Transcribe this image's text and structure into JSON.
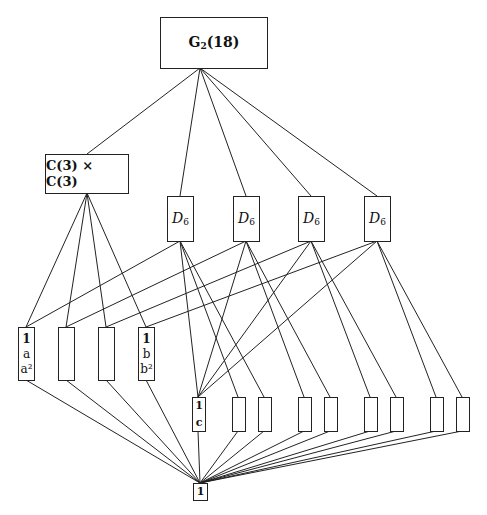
{
  "diagram": {
    "root": {
      "label": "G",
      "sub": "2",
      "suffix": "(18)"
    },
    "c3xc3": {
      "label": "C(3) × C(3)"
    },
    "d6": [
      {
        "label": "D",
        "sub": "6"
      },
      {
        "label": "D",
        "sub": "6"
      },
      {
        "label": "D",
        "sub": "6"
      },
      {
        "label": "D",
        "sub": "6"
      }
    ],
    "order3": [
      {
        "lines": [
          "1",
          "a",
          "a²"
        ]
      },
      {
        "lines": []
      },
      {
        "lines": []
      },
      {
        "lines": [
          "1",
          "b",
          "b²"
        ]
      }
    ],
    "order2": [
      {
        "lines": [
          "1",
          "c"
        ]
      },
      {
        "lines": []
      },
      {
        "lines": []
      },
      {
        "lines": []
      },
      {
        "lines": []
      },
      {
        "lines": []
      },
      {
        "lines": []
      },
      {
        "lines": []
      },
      {
        "lines": []
      }
    ],
    "trivial": {
      "label": "1"
    }
  }
}
